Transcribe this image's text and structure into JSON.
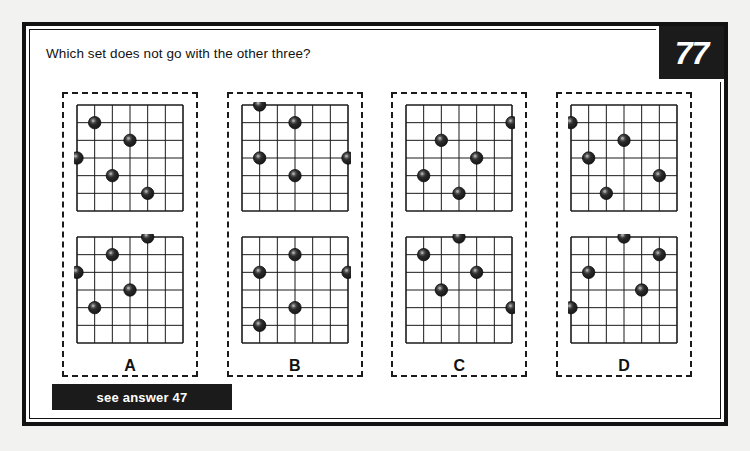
{
  "page": {
    "question": "Which set does not go with the other three?",
    "badge_number": "77",
    "answer_bar_text": "see answer 47",
    "colors": {
      "ink": "#1b1b1b",
      "paper": "#ffffff",
      "background": "#f2f2f0",
      "ball_dark": "#2a2a2a",
      "ball_highlight": "#8d8d8d"
    }
  },
  "grid_spec": {
    "columns": 6,
    "rows": 6,
    "note": "balls sit on grid line intersections; coordinates are (col,row) from 0..6"
  },
  "options": [
    {
      "label": "A",
      "top_grid": {
        "balls": [
          {
            "col": 1,
            "row": 1
          },
          {
            "col": 3,
            "row": 2
          },
          {
            "col": 0,
            "row": 3
          },
          {
            "col": 2,
            "row": 4
          },
          {
            "col": 4,
            "row": 5
          }
        ]
      },
      "bottom_grid": {
        "balls": [
          {
            "col": 4,
            "row": 0
          },
          {
            "col": 2,
            "row": 1
          },
          {
            "col": 0,
            "row": 2
          },
          {
            "col": 3,
            "row": 3
          },
          {
            "col": 1,
            "row": 4
          }
        ]
      }
    },
    {
      "label": "B",
      "top_grid": {
        "balls": [
          {
            "col": 1,
            "row": 0
          },
          {
            "col": 3,
            "row": 1
          },
          {
            "col": 1,
            "row": 3
          },
          {
            "col": 6,
            "row": 3
          },
          {
            "col": 3,
            "row": 4
          }
        ]
      },
      "bottom_grid": {
        "balls": [
          {
            "col": 3,
            "row": 1
          },
          {
            "col": 1,
            "row": 2
          },
          {
            "col": 6,
            "row": 2
          },
          {
            "col": 3,
            "row": 4
          },
          {
            "col": 1,
            "row": 5
          }
        ]
      }
    },
    {
      "label": "C",
      "top_grid": {
        "balls": [
          {
            "col": 6,
            "row": 1
          },
          {
            "col": 2,
            "row": 2
          },
          {
            "col": 4,
            "row": 3
          },
          {
            "col": 1,
            "row": 4
          },
          {
            "col": 3,
            "row": 5
          }
        ]
      },
      "bottom_grid": {
        "balls": [
          {
            "col": 3,
            "row": 0
          },
          {
            "col": 1,
            "row": 1
          },
          {
            "col": 4,
            "row": 2
          },
          {
            "col": 2,
            "row": 3
          },
          {
            "col": 6,
            "row": 4
          }
        ]
      }
    },
    {
      "label": "D",
      "top_grid": {
        "balls": [
          {
            "col": 0,
            "row": 1
          },
          {
            "col": 3,
            "row": 2
          },
          {
            "col": 1,
            "row": 3
          },
          {
            "col": 5,
            "row": 4
          },
          {
            "col": 2,
            "row": 5
          }
        ]
      },
      "bottom_grid": {
        "balls": [
          {
            "col": 3,
            "row": 0
          },
          {
            "col": 5,
            "row": 1
          },
          {
            "col": 1,
            "row": 2
          },
          {
            "col": 4,
            "row": 3
          },
          {
            "col": 0,
            "row": 4
          }
        ]
      }
    }
  ]
}
